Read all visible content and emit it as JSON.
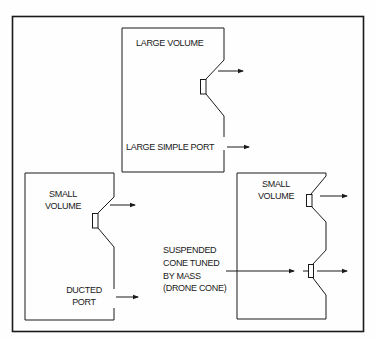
{
  "diagram": {
    "colors": {
      "ink": "#1a1a1a",
      "background": "#fefefe"
    },
    "enclosures": [
      {
        "id": "large-simple-port",
        "volume_label": "LARGE VOLUME",
        "port_label": "LARGE SIMPLE PORT"
      },
      {
        "id": "ducted-port",
        "volume_label_line1": "SMALL",
        "volume_label_line2": "VOLUME",
        "port_label_line1": "DUCTED",
        "port_label_line2": "PORT"
      },
      {
        "id": "drone-cone",
        "volume_label_line1": "SMALL",
        "volume_label_line2": "VOLUME",
        "passive_label_lines": [
          "SUSPENDED",
          "CONE TUNED",
          "BY MASS",
          "(DRONE CONE)"
        ]
      }
    ]
  }
}
